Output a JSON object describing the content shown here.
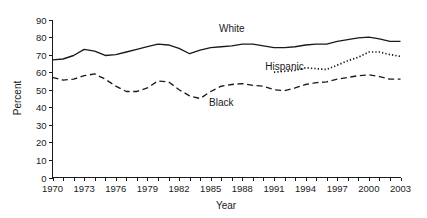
{
  "chart_data": {
    "type": "line",
    "title": "",
    "xlabel": "Year",
    "ylabel": "Percent",
    "xlim": [
      1970,
      2003
    ],
    "ylim": [
      0,
      90
    ],
    "ytick_step": 10,
    "xtick_step": 1,
    "xtick_label_step": 3,
    "grid": false,
    "legend": "inline-annotations",
    "ytick_labels": [
      "0",
      "10",
      "20",
      "30",
      "40",
      "50",
      "60",
      "70",
      "80",
      "90"
    ],
    "ytick_values": [
      0,
      10,
      20,
      30,
      40,
      50,
      60,
      70,
      80,
      90
    ],
    "xtick_labels": [
      "1970",
      "1973",
      "1976",
      "1979",
      "1982",
      "1985",
      "1988",
      "1991",
      "1994",
      "1997",
      "2000",
      "2003"
    ],
    "xtick_values": [
      1970,
      1973,
      1976,
      1979,
      1982,
      1985,
      1988,
      1991,
      1994,
      1997,
      2000,
      2003
    ],
    "x": [
      1970,
      1971,
      1972,
      1973,
      1974,
      1975,
      1976,
      1977,
      1978,
      1979,
      1980,
      1981,
      1982,
      1983,
      1984,
      1985,
      1986,
      1987,
      1988,
      1989,
      1990,
      1991,
      1992,
      1993,
      1994,
      1995,
      1996,
      1997,
      1998,
      1999,
      2000,
      2001,
      2002,
      2003
    ],
    "series": [
      {
        "name": "White",
        "style": "solid",
        "color": "#1a1a1a",
        "label_x": 1987,
        "label_y": 83,
        "values": [
          67,
          67.5,
          69.5,
          73,
          72,
          69.5,
          70,
          71.5,
          73,
          74.5,
          76,
          75.5,
          73.5,
          70.5,
          72.5,
          74,
          74.5,
          75,
          76,
          76,
          75,
          74,
          74,
          74.5,
          75.5,
          76,
          76,
          77.5,
          78.5,
          79.5,
          80,
          79,
          77.5,
          77.5
        ]
      },
      {
        "name": "Black",
        "style": "dashed",
        "color": "#1a1a1a",
        "label_x": 1986,
        "label_y": 41,
        "values": [
          57,
          55.5,
          56,
          58,
          59,
          56,
          52,
          49,
          49,
          51,
          55,
          54.5,
          50,
          46.5,
          45,
          49,
          52,
          53,
          53.5,
          52.5,
          52,
          50,
          49.5,
          51,
          53,
          54,
          54.5,
          56,
          57,
          58,
          58.5,
          57.5,
          56,
          56
        ]
      },
      {
        "name": "Hispanic",
        "style": "dotted",
        "color": "#1a1a1a",
        "label_x": 1992,
        "label_y": 61.5,
        "start_year": 1991,
        "values": [
          null,
          null,
          null,
          null,
          null,
          null,
          null,
          null,
          null,
          null,
          null,
          null,
          null,
          null,
          null,
          null,
          null,
          null,
          null,
          null,
          null,
          60,
          60.5,
          61,
          62.5,
          62,
          61.5,
          64,
          66.5,
          68.5,
          71.5,
          71.5,
          70,
          69
        ]
      }
    ]
  },
  "figure": {
    "ylabel_text": "Percent",
    "xlabel_text": "Year"
  }
}
